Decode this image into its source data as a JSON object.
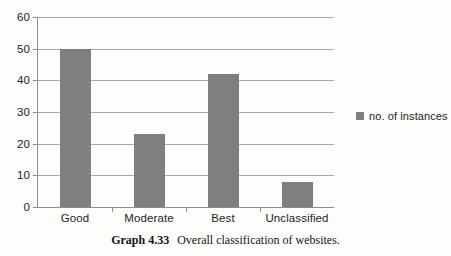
{
  "chart_data": {
    "type": "bar",
    "title": "",
    "categories": [
      "Good",
      "Moderate",
      "Best",
      "Unclassified"
    ],
    "values": [
      50,
      23,
      42,
      8
    ],
    "series": [
      {
        "name": "no. of instances",
        "values": [
          50,
          23,
          42,
          8
        ]
      }
    ],
    "xlabel": "",
    "ylabel": "",
    "ylim": [
      0,
      60
    ],
    "ytick_step": 10,
    "yticks": [
      "60",
      "50",
      "40",
      "30",
      "20",
      "10",
      "0"
    ],
    "grid": true,
    "legend_position": "right",
    "bar_color": "#7f7f7f",
    "gridline_color": "#a8a8a8",
    "background_color": "#fdfdfc"
  },
  "legend": {
    "entries": [
      {
        "label": "no. of instances",
        "color": "#7f7f7f"
      }
    ]
  },
  "caption": {
    "label": "Graph 4.33",
    "text": "Overall classification of websites."
  }
}
